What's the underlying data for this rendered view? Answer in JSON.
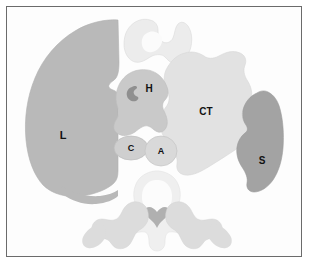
{
  "figure": {
    "frame_border_color": "#6b6b6b",
    "background_color": "#ffffff"
  },
  "labels": {
    "lung": "L",
    "heart": "H",
    "chest_tumor": "CT",
    "scapula_soft_tissue": "S",
    "cava": "C",
    "aorta": "A"
  },
  "colors": {
    "lung": "#b9b9b9",
    "heart": "#c9c9c9",
    "heart_notch": "#8f8f8f",
    "chest_tumor": "#e2e2e2",
    "scapula_soft_tissue": "#a3a3a3",
    "cava": "#cfcfcf",
    "aorta": "#d9d9d9",
    "sternum": "#ececec",
    "vertebra": "#efefef",
    "spinal_cord": "#b0b0b0",
    "posterior_ribs": "#dcdcdc",
    "outline": "#c4c4c4",
    "label_text": "#111111"
  },
  "regions": [
    {
      "key": "lung",
      "name": "left-lung",
      "label": "L",
      "tone": "medium-gray"
    },
    {
      "key": "heart",
      "name": "heart",
      "label": "H",
      "tone": "light-medium-gray"
    },
    {
      "key": "chest_tumor",
      "name": "chest-tumor",
      "label": "CT",
      "tone": "very-light-gray"
    },
    {
      "key": "scapula_soft_tissue",
      "name": "scapula-soft-tissue",
      "label": "S",
      "tone": "dark-gray"
    },
    {
      "key": "cava",
      "name": "vena-cava",
      "label": "C",
      "tone": "light-gray"
    },
    {
      "key": "aorta",
      "name": "aorta",
      "label": "A",
      "tone": "light-gray"
    },
    {
      "key": "sternum",
      "name": "sternum",
      "label": "",
      "tone": "near-white"
    },
    {
      "key": "vertebra",
      "name": "vertebra",
      "label": "",
      "tone": "near-white"
    },
    {
      "key": "posterior_ribs",
      "name": "posterior-rib-structures",
      "label": "",
      "tone": "pale-gray"
    }
  ]
}
